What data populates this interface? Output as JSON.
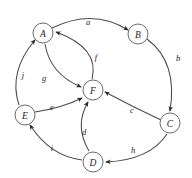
{
  "figure": {
    "name": "directed-graph-diagram",
    "width": 192,
    "height": 178,
    "background_color": "#ffffff",
    "node_stroke_color": "#6b6b6b",
    "node_fill_color": "#ffffff",
    "edge_color": "#4a4a4a",
    "label_color": "#1a1a1a"
  },
  "graph_data": {
    "type": "directed-graph",
    "node_count": 6,
    "edge_count": 10,
    "nodes": [
      {
        "id": "A",
        "label": "A",
        "x": 43,
        "y": 33,
        "r": 10
      },
      {
        "id": "B",
        "label": "B",
        "x": 138,
        "y": 34,
        "r": 10
      },
      {
        "id": "C",
        "label": "C",
        "x": 170,
        "y": 123,
        "r": 10
      },
      {
        "id": "D",
        "label": "D",
        "x": 93,
        "y": 162,
        "r": 10
      },
      {
        "id": "E",
        "label": "E",
        "x": 25,
        "y": 115,
        "r": 10
      },
      {
        "id": "F",
        "label": "F",
        "x": 93,
        "y": 90,
        "r": 10
      }
    ],
    "edges": [
      {
        "id": "a",
        "label": "a",
        "from": "A",
        "to": "B",
        "label_x": 88,
        "label_y": 22,
        "path": "M 52 28 Q 93 8 128 30"
      },
      {
        "id": "b",
        "label": "b",
        "from": "B",
        "to": "C",
        "label_x": 178,
        "label_y": 58,
        "path": "M 147 39 Q 178 62 170 111"
      },
      {
        "id": "c",
        "label": "c",
        "from": "C",
        "to": "F",
        "label_x": 132,
        "label_y": 110,
        "path": "M 161 120 Q 133 107 105 92"
      },
      {
        "id": "d",
        "label": "d",
        "from": "D",
        "to": "F",
        "label_x": 84,
        "label_y": 132,
        "path": "M 89 151 Q 74 126 88 102"
      },
      {
        "id": "e",
        "label": "e",
        "from": "E",
        "to": "F",
        "label_x": 52,
        "label_y": 107,
        "path": "M 35 112 Q 62 108 82 98"
      },
      {
        "id": "f",
        "label": "f",
        "from": "F",
        "to": "A",
        "label_x": 96,
        "label_y": 57,
        "path": "M 92 79 Q 100 48 56 32"
      },
      {
        "id": "g",
        "label": "g",
        "from": "A",
        "to": "F",
        "label_x": 44,
        "label_y": 78,
        "path": "M 45 44 Q 50 74 81 87"
      },
      {
        "id": "h",
        "label": "h",
        "from": "C",
        "to": "D",
        "label_x": 133,
        "label_y": 150,
        "path": "M 167 134 Q 150 160 106 162"
      },
      {
        "id": "i",
        "label": "i",
        "from": "D",
        "to": "E",
        "label_x": 52,
        "label_y": 148,
        "path": "M 82 160 Q 50 156 30 125"
      },
      {
        "id": "j",
        "label": "j",
        "from": "E",
        "to": "A",
        "label_x": 23,
        "label_y": 75,
        "path": "M 19 105 Q 8 72 35 40"
      }
    ]
  }
}
